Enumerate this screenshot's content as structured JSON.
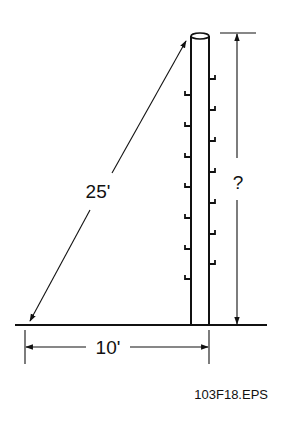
{
  "diagram": {
    "labels": {
      "hypotenuse": "25'",
      "base": "10'",
      "height": "?"
    },
    "caption": "103F18.EPS",
    "colors": {
      "stroke": "#111111",
      "background": "#ffffff"
    },
    "pole": {
      "step_count_left": 7,
      "step_count_right": 7
    }
  }
}
